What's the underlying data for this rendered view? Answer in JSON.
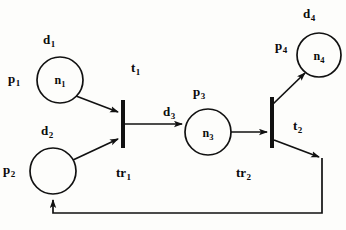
{
  "diagram": {
    "stroke_color": "#111111",
    "background_color": "#fdfdfb",
    "places": [
      {
        "id": "p1",
        "place_label": "p",
        "place_sub": "1",
        "token_label": "n",
        "token_sub": "1",
        "data_label": "d",
        "data_sub": "1",
        "cx": 60,
        "cy": 80,
        "r": 23
      },
      {
        "id": "p2",
        "place_label": "p",
        "place_sub": "2",
        "token_label": "",
        "token_sub": "",
        "data_label": "d",
        "data_sub": "2",
        "cx": 53,
        "cy": 171,
        "r": 23
      },
      {
        "id": "p3",
        "place_label": "p",
        "place_sub": "3",
        "token_label": "n",
        "token_sub": "3",
        "data_label": "d",
        "data_sub": "3",
        "cx": 208,
        "cy": 132,
        "r": 23
      },
      {
        "id": "p4",
        "place_label": "p",
        "place_sub": "4",
        "token_label": "n",
        "token_sub": "4",
        "data_label": "d",
        "data_sub": "4",
        "cx": 319,
        "cy": 55,
        "r": 22
      }
    ],
    "transitions": [
      {
        "id": "tr1",
        "name_label": "tr",
        "name_sub": "1",
        "token_label": "t",
        "token_sub": "1",
        "x": 123,
        "y_top": 100,
        "y_bottom": 148
      },
      {
        "id": "tr2",
        "name_label": "tr",
        "name_sub": "2",
        "token_label": "t",
        "token_sub": "2",
        "x": 272,
        "y_top": 97,
        "y_bottom": 148
      }
    ],
    "arcs": [
      {
        "from": "p1",
        "to": "tr1"
      },
      {
        "from": "p2",
        "to": "tr1"
      },
      {
        "from": "tr1",
        "to": "p3"
      },
      {
        "from": "p3",
        "to": "tr2"
      },
      {
        "from": "tr2",
        "to": "p4"
      },
      {
        "from": "tr2",
        "to": "p2",
        "style": "feedback-loop"
      }
    ]
  },
  "labels": {
    "d1": {
      "text": "d",
      "sub": "1",
      "x": 43,
      "y": 33
    },
    "p1": {
      "text": "p",
      "sub": "1",
      "x": 8,
      "y": 72
    },
    "n1": {
      "text": "n",
      "sub": "1",
      "x": 60,
      "y": 80
    },
    "d2": {
      "text": "d",
      "sub": "2",
      "x": 41,
      "y": 124
    },
    "p2": {
      "text": "p",
      "sub": "2",
      "x": 3,
      "y": 163
    },
    "t1": {
      "text": "t",
      "sub": "1",
      "x": 131,
      "y": 61
    },
    "tr1": {
      "text": "tr",
      "sub": "1",
      "x": 116,
      "y": 166
    },
    "d3": {
      "text": "d",
      "sub": "3",
      "x": 163,
      "y": 105
    },
    "p3": {
      "text": "p",
      "sub": "3",
      "x": 193,
      "y": 85
    },
    "n3": {
      "text": "n",
      "sub": "3",
      "x": 208,
      "y": 133
    },
    "tr2": {
      "text": "tr",
      "sub": "2",
      "x": 236,
      "y": 166
    },
    "t2": {
      "text": "t",
      "sub": "2",
      "x": 293,
      "y": 119
    },
    "d4": {
      "text": "d",
      "sub": "4",
      "x": 303,
      "y": 7
    },
    "p4": {
      "text": "p",
      "sub": "4",
      "x": 275,
      "y": 39
    },
    "n4": {
      "text": "n",
      "sub": "4",
      "x": 319,
      "y": 56
    }
  }
}
